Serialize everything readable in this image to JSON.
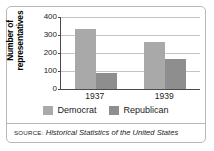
{
  "chart_data": {
    "type": "bar",
    "title": "",
    "xlabel": "",
    "ylabel": "Number of representatives",
    "categories": [
      "1937",
      "1939"
    ],
    "series": [
      {
        "name": "Democrat",
        "values": [
          334,
          262
        ],
        "color": "#a9a9a9"
      },
      {
        "name": "Republican",
        "values": [
          88,
          169
        ],
        "color": "#8e8e8e"
      }
    ],
    "ylim": [
      0,
      400
    ],
    "yticks": [
      0,
      100,
      200,
      300,
      400
    ],
    "ytick_labels": [
      "0",
      "100",
      "200",
      "300",
      "400"
    ],
    "grid": true,
    "legend_position": "bottom"
  },
  "axis": {
    "y_title": "Number of representatives",
    "ticks": [
      "400",
      "300",
      "200",
      "100",
      "0"
    ],
    "x_labels": [
      "1937",
      "1939"
    ]
  },
  "legend": {
    "items": [
      {
        "label": "Democrat",
        "color": "#a9a9a9"
      },
      {
        "label": "Republican",
        "color": "#8e8e8e"
      }
    ]
  },
  "source": {
    "kicker": "SOURCE:",
    "title": "Historical Statistics of the United States"
  },
  "colors": {
    "democrat": "#a9a9a9",
    "republican": "#8e8e8e",
    "axis": "#4a4a4a",
    "grid": "#c4c4c4",
    "border": "#b9b9b9"
  }
}
